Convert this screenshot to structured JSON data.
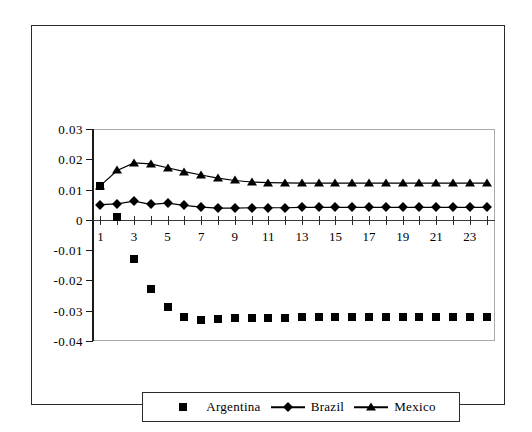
{
  "chart_data": {
    "type": "line",
    "title": "",
    "subtitle": "",
    "xlabel": "",
    "ylabel": "",
    "x": [
      1,
      2,
      3,
      4,
      5,
      6,
      7,
      8,
      9,
      10,
      11,
      12,
      13,
      14,
      15,
      16,
      17,
      18,
      19,
      20,
      21,
      22,
      23,
      24
    ],
    "xtick_labels": [
      "1",
      "3",
      "5",
      "7",
      "9",
      "11",
      "13",
      "15",
      "17",
      "19",
      "21",
      "23"
    ],
    "xtick_values": [
      1,
      3,
      5,
      7,
      9,
      11,
      13,
      15,
      17,
      19,
      21,
      23
    ],
    "ytick_labels": [
      "0.03",
      "0.02",
      "0.01",
      "0",
      "-0.01",
      "-0.02",
      "-0.03",
      "-0.04"
    ],
    "ytick_values": [
      0.03,
      0.02,
      0.01,
      0,
      -0.01,
      -0.02,
      -0.03,
      -0.04
    ],
    "ylim": [
      -0.04,
      0.03
    ],
    "xlim": [
      0.5,
      24.5
    ],
    "grid": false,
    "legend_position": "bottom",
    "series": [
      {
        "name": "Argentina",
        "marker": "square",
        "line": false,
        "color": "#000000",
        "values": [
          0.0112,
          0.001,
          -0.013,
          -0.0228,
          -0.0288,
          -0.032,
          -0.033,
          -0.0328,
          -0.0325,
          -0.0324,
          -0.0323,
          -0.0323,
          -0.0322,
          -0.0322,
          -0.0322,
          -0.0322,
          -0.0322,
          -0.0322,
          -0.0322,
          -0.0322,
          -0.0322,
          -0.0322,
          -0.0322,
          -0.0322
        ]
      },
      {
        "name": "Brazil",
        "marker": "diamond",
        "line": true,
        "color": "#000000",
        "values": [
          0.005,
          0.0053,
          0.0062,
          0.0051,
          0.0055,
          0.0048,
          0.0042,
          0.0039,
          0.0039,
          0.004,
          0.004,
          0.004,
          0.0041,
          0.0041,
          0.0041,
          0.0041,
          0.0041,
          0.0041,
          0.0041,
          0.0041,
          0.0041,
          0.0041,
          0.0041,
          0.0041
        ]
      },
      {
        "name": "Mexico",
        "marker": "triangle",
        "line": true,
        "color": "#000000",
        "values": [
          0.0113,
          0.0163,
          0.0188,
          0.0185,
          0.0172,
          0.0159,
          0.0148,
          0.0138,
          0.013,
          0.0125,
          0.0123,
          0.0122,
          0.0121,
          0.0121,
          0.0121,
          0.0121,
          0.0121,
          0.0121,
          0.0121,
          0.0121,
          0.0121,
          0.0121,
          0.0121,
          0.0121
        ]
      }
    ]
  },
  "legend": {
    "entries": [
      {
        "label": "Argentina",
        "marker": "square",
        "line": false
      },
      {
        "label": "Brazil",
        "marker": "diamond",
        "line": true
      },
      {
        "label": "Mexico",
        "marker": "triangle",
        "line": true
      }
    ]
  }
}
